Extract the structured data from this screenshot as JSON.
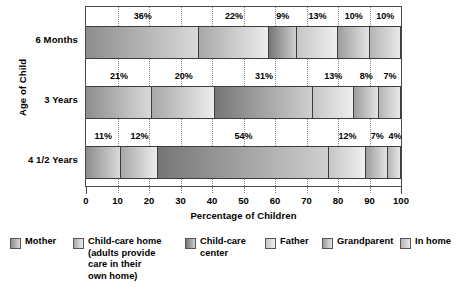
{
  "chart_data": {
    "type": "bar",
    "orientation": "horizontal",
    "stacked": true,
    "stack_normalized": true,
    "title": "",
    "xlabel": "Percentage of Children",
    "ylabel": "Age of Child",
    "xlim": [
      0,
      100
    ],
    "xticks": [
      "0",
      "10",
      "20",
      "30",
      "40",
      "50",
      "60",
      "70",
      "80",
      "90",
      "100"
    ],
    "grid": "vertical-dotted",
    "legend_position": "bottom",
    "categories": [
      "6 Months",
      "3 Years",
      "4 1/2 Years"
    ],
    "series": [
      {
        "name": "Mother",
        "color": "#8d8d8d",
        "color_light": "#d9d9d9",
        "values": [
          36,
          21,
          11
        ],
        "labels": [
          "36%",
          "21%",
          "11%"
        ]
      },
      {
        "name": "Child-care home\n(adults provide\ncare in their\nown home)",
        "color": "#a8a8a8",
        "color_light": "#ececec",
        "values": [
          22,
          20,
          12
        ],
        "labels": [
          "22%",
          "20%",
          "12%"
        ]
      },
      {
        "name": "Child-care\ncenter",
        "color": "#767676",
        "color_light": "#cfcfcf",
        "values": [
          9,
          31,
          54
        ],
        "labels": [
          "9%",
          "31%",
          "54%"
        ]
      },
      {
        "name": "Father",
        "color": "#c6c6c6",
        "color_light": "#efefef",
        "values": [
          13,
          13,
          12
        ],
        "labels": [
          "13%",
          "13%",
          "12%"
        ]
      },
      {
        "name": "Grandparent",
        "color": "#9d9d9d",
        "color_light": "#e3e3e3",
        "values": [
          10,
          8,
          7
        ],
        "labels": [
          "10%",
          "8%",
          "7%"
        ]
      },
      {
        "name": "In home",
        "color": "#b4b4b4",
        "color_light": "#e8e8e8",
        "values": [
          10,
          7,
          4
        ],
        "labels": [
          "10%",
          "7%",
          "4%"
        ]
      }
    ]
  }
}
